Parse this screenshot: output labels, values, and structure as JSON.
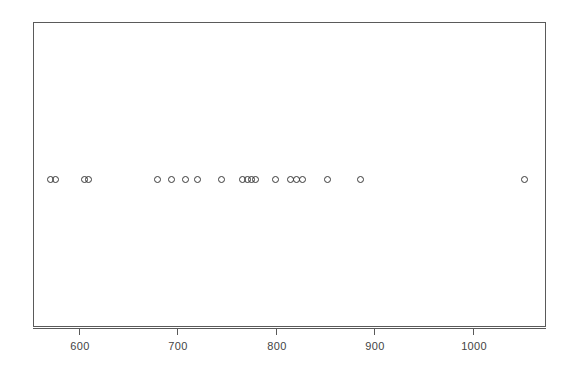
{
  "chart_data": {
    "type": "scatter",
    "title": "",
    "subtitle": "",
    "xlabel": "",
    "ylabel": "",
    "legend": [],
    "grid": false,
    "legend_position": "none",
    "axis": {
      "x": {
        "ticks": [
          600,
          700,
          800,
          900,
          1000
        ],
        "tick_labels": [
          "600",
          "700",
          "800",
          "900",
          "1000"
        ],
        "range": [
          562,
          1083
        ],
        "visible": true
      },
      "y": {
        "ticks": [],
        "tick_labels": [],
        "range": [
          0,
          1
        ],
        "visible": false
      }
    },
    "marker": {
      "shape": "open-circle",
      "size_px": 7,
      "edge_color": "#3a3a3a",
      "fill_color": "none"
    },
    "series": [
      {
        "name": "observations",
        "y_constant": 0.5,
        "x": [
          571,
          576,
          605,
          609,
          679,
          694,
          708,
          720,
          744,
          766,
          771,
          775,
          779,
          799,
          814,
          821,
          827,
          852,
          886,
          1052
        ]
      }
    ],
    "n_points": 20
  },
  "plot": {
    "frame": {
      "left": 33,
      "top": 22,
      "width": 513,
      "height": 305
    },
    "frame_color": "#5a5a5a",
    "background": "#ffffff",
    "dot_row_y_px": 179
  },
  "axis_labels": {
    "t600": "600",
    "t700": "700",
    "t800": "800",
    "t900": "900",
    "t1000": "1000"
  }
}
